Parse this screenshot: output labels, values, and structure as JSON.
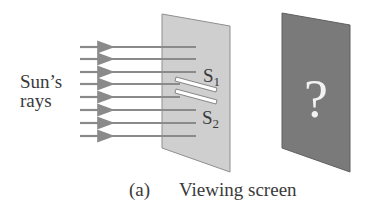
{
  "diagram": {
    "type": "double-slit-setup",
    "source_label_line1": "Sun’s",
    "source_label_line2": "rays",
    "ray_count": 8,
    "slit_labels": {
      "s1_main": "S",
      "s1_sub": "1",
      "s2_main": "S",
      "s2_sub": "2"
    },
    "screen_mark": "?",
    "caption_tag": "(a)",
    "caption_text": "Viewing screen",
    "colors": {
      "ray": "#8a8a8a",
      "slit_panel": "#cfcfcf",
      "slit_panel_edge": "#8f8f8f",
      "viewing_screen": "#7a7a7a",
      "viewing_screen_edge": "#5f5f5f",
      "slit": "#ffffff",
      "text": "#3a3a3a"
    }
  }
}
